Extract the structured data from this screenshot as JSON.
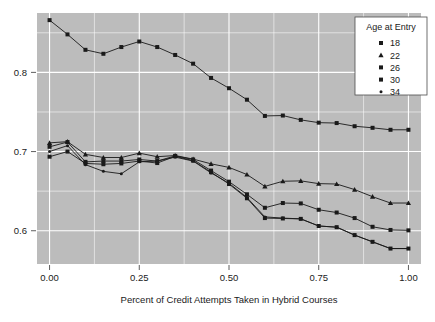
{
  "chart_data": {
    "type": "line",
    "title": "",
    "xlabel": "Percent of Credit Attempts Taken in Hybrid Courses",
    "ylabel": "",
    "xlim": [
      -0.035,
      1.035
    ],
    "ylim": [
      0.558,
      0.875
    ],
    "xticks": [
      0.0,
      0.25,
      0.5,
      0.75,
      1.0
    ],
    "xticklabels": [
      "0.00",
      "0.25",
      "0.50",
      "0.75",
      "1.00"
    ],
    "yticks": [
      0.6,
      0.7,
      0.8
    ],
    "yticklabels": [
      "0.6",
      "0.7",
      "0.8"
    ],
    "grid": true,
    "grid_color": "#ffffff",
    "panel_background": "#bcbcbc",
    "line_color": "#1a1a1a",
    "legend": {
      "title": "Age at Entry",
      "position": "top-right",
      "entries": [
        {
          "label": "18",
          "marker": "square"
        },
        {
          "label": "22",
          "marker": "triangle"
        },
        {
          "label": "26",
          "marker": "square"
        },
        {
          "label": "30",
          "marker": "square"
        },
        {
          "label": "34",
          "marker": "dot"
        }
      ]
    },
    "x": [
      0.0,
      0.05,
      0.1,
      0.15,
      0.2,
      0.25,
      0.3,
      0.35,
      0.4,
      0.45,
      0.5,
      0.55,
      0.6,
      0.65,
      0.7,
      0.75,
      0.8,
      0.85,
      0.9,
      0.95,
      1.0
    ],
    "series": [
      {
        "name": "18",
        "marker": "square",
        "values": [
          0.866,
          0.848,
          0.8285,
          0.8235,
          0.832,
          0.839,
          0.832,
          0.822,
          0.811,
          0.793,
          0.78,
          0.7655,
          0.745,
          0.7455,
          0.74,
          0.7365,
          0.736,
          0.732,
          0.73,
          0.7275,
          0.7275
        ]
      },
      {
        "name": "22",
        "marker": "triangle",
        "values": [
          0.711,
          0.7125,
          0.6965,
          0.6925,
          0.6925,
          0.698,
          0.6935,
          0.695,
          0.6905,
          0.6845,
          0.68,
          0.671,
          0.656,
          0.6625,
          0.663,
          0.6595,
          0.659,
          0.652,
          0.643,
          0.635,
          0.635
        ]
      },
      {
        "name": "26",
        "marker": "square",
        "values": [
          0.706,
          0.712,
          0.687,
          0.688,
          0.688,
          0.69,
          0.688,
          0.6945,
          0.69,
          0.676,
          0.662,
          0.646,
          0.629,
          0.635,
          0.6345,
          0.6265,
          0.623,
          0.616,
          0.605,
          0.601,
          0.6005
        ]
      },
      {
        "name": "30",
        "marker": "square",
        "values": [
          0.6935,
          0.7,
          0.685,
          0.684,
          0.685,
          0.688,
          0.6855,
          0.694,
          0.6885,
          0.674,
          0.659,
          0.641,
          0.616,
          0.6155,
          0.615,
          0.606,
          0.6045,
          0.5945,
          0.586,
          0.5775,
          0.5775
        ]
      },
      {
        "name": "34",
        "marker": "dot",
        "values": [
          0.7,
          0.7075,
          0.6835,
          0.675,
          0.672,
          0.687,
          0.688,
          0.693,
          0.688,
          0.673,
          0.66,
          0.642,
          0.6175,
          0.616,
          0.615,
          0.606,
          0.6045,
          0.5945,
          0.586,
          0.5775,
          0.5775
        ]
      }
    ]
  }
}
